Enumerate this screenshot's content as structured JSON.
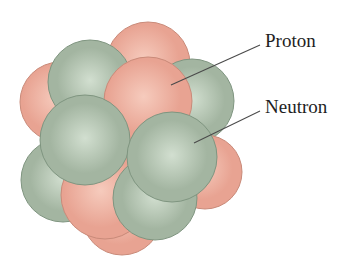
{
  "diagram": {
    "labels": {
      "proton": "Proton",
      "neutron": "Neutron"
    },
    "colors": {
      "proton_fill": "#e8a392",
      "proton_highlight": "#f6cbbd",
      "proton_edge": "#c98a79",
      "neutron_fill": "#a3b5a1",
      "neutron_highlight": "#d2dfd0",
      "neutron_edge": "#7f9580",
      "leader_line": "#4a4a4a",
      "background": "#ffffff"
    },
    "particles": [
      {
        "type": "proton",
        "cx": 148,
        "cy": 64,
        "r": 42
      },
      {
        "type": "proton",
        "cx": 60,
        "cy": 102,
        "r": 40
      },
      {
        "type": "neutron",
        "cx": 192,
        "cy": 101,
        "r": 42
      },
      {
        "type": "proton",
        "cx": 205,
        "cy": 172,
        "r": 37
      },
      {
        "type": "proton",
        "cx": 122,
        "cy": 215,
        "r": 40
      },
      {
        "type": "neutron",
        "cx": 63,
        "cy": 180,
        "r": 42
      },
      {
        "type": "neutron",
        "cx": 90,
        "cy": 82,
        "r": 42
      },
      {
        "type": "proton",
        "cx": 148,
        "cy": 101,
        "r": 44
      },
      {
        "type": "proton",
        "cx": 105,
        "cy": 195,
        "r": 44
      },
      {
        "type": "neutron",
        "cx": 155,
        "cy": 198,
        "r": 42
      },
      {
        "type": "neutron",
        "cx": 85,
        "cy": 140,
        "r": 45
      },
      {
        "type": "neutron",
        "cx": 172,
        "cy": 157,
        "r": 45
      }
    ],
    "leader_lines": {
      "proton": {
        "x1": 260,
        "y1": 45,
        "x2": 171,
        "y2": 85
      },
      "neutron": {
        "x1": 260,
        "y1": 111,
        "x2": 194,
        "y2": 143
      }
    }
  }
}
